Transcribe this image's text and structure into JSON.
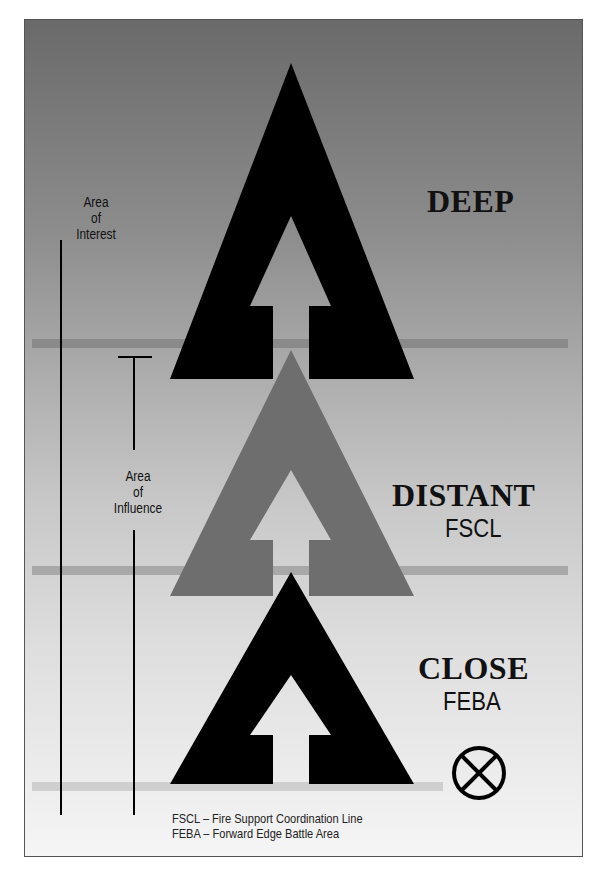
{
  "diagram": {
    "type": "battlefield-zones",
    "zones": [
      {
        "title": "DEEP",
        "subtitle": "",
        "arrow_color": "#000000"
      },
      {
        "title": "DISTANT",
        "subtitle": "FSCL",
        "arrow_color": "#6e6e6e"
      },
      {
        "title": "CLOSE",
        "subtitle": "FEBA",
        "arrow_color": "#000000"
      }
    ],
    "area_of_interest": {
      "line1": "Area",
      "line2": "of",
      "line3": "Interest"
    },
    "area_of_influence": {
      "line1": "Area",
      "line2": "of",
      "line3": "Influence"
    },
    "symbol": "circle-x-icon",
    "legend": [
      "FSCL – Fire Support Coordination Line",
      "FEBA – Forward Edge Battle Area"
    ],
    "colors": {
      "line_band": "#999999",
      "dark_arrow": "#000000",
      "gray_arrow": "#6e6e6e"
    }
  }
}
